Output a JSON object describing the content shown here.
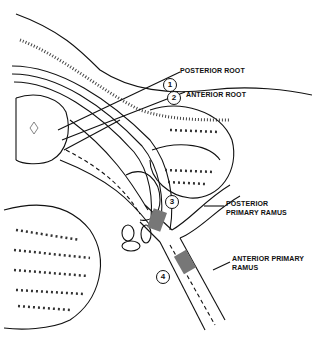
{
  "diagram": {
    "type": "anatomical-cross-section",
    "labels": {
      "posterior_root": "POSTERIOR ROOT",
      "anterior_root": "ANTERIOR ROOT",
      "posterior_primary_ramus_line1": "POSTERIOR",
      "posterior_primary_ramus_line2": "PRIMARY RAMUS",
      "anterior_primary_ramus_line1": "ANTERIOR PRIMARY",
      "anterior_primary_ramus_line2": "RAMUS"
    },
    "markers": [
      "1",
      "2",
      "3",
      "4"
    ],
    "colors": {
      "ink": "#111111",
      "background": "#ffffff",
      "shading": "#777777"
    }
  }
}
